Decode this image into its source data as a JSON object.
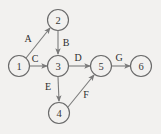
{
  "diagram": {
    "type": "directed-graph",
    "background_color": "#f2f1ef",
    "node_stroke_color": "#6a6a6a",
    "edge_stroke_color": "#7a7a7a",
    "text_color": "#2e2e2e",
    "nodes": [
      {
        "id": "1",
        "label": "1",
        "cx": 19,
        "cy": 66,
        "r": 10.5
      },
      {
        "id": "2",
        "label": "2",
        "cx": 58,
        "cy": 20,
        "r": 10.5
      },
      {
        "id": "3",
        "label": "3",
        "cx": 58,
        "cy": 66,
        "r": 10.5
      },
      {
        "id": "4",
        "label": "4",
        "cx": 59,
        "cy": 113,
        "r": 10.5
      },
      {
        "id": "5",
        "label": "5",
        "cx": 101,
        "cy": 66,
        "r": 10.5
      },
      {
        "id": "6",
        "label": "6",
        "cx": 141,
        "cy": 66,
        "r": 10.5
      }
    ],
    "edges": [
      {
        "id": "A",
        "label": "A",
        "from": "1",
        "to": "2",
        "x1": 26,
        "y1": 58,
        "x2": 50,
        "y2": 28,
        "lx": 28,
        "ly": 38
      },
      {
        "id": "B",
        "label": "B",
        "from": "2",
        "to": "3",
        "x1": 58,
        "y1": 31,
        "x2": 58,
        "y2": 54,
        "lx": 66,
        "ly": 42
      },
      {
        "id": "C",
        "label": "C",
        "from": "1",
        "to": "3",
        "x1": 30,
        "y1": 66,
        "x2": 47,
        "y2": 66,
        "lx": 35,
        "ly": 58
      },
      {
        "id": "D",
        "label": "D",
        "from": "3",
        "to": "5",
        "x1": 69,
        "y1": 66,
        "x2": 90,
        "y2": 66,
        "lx": 78,
        "ly": 57
      },
      {
        "id": "E",
        "label": "E",
        "from": "3",
        "to": "4",
        "x1": 58,
        "y1": 77,
        "x2": 59,
        "y2": 101,
        "lx": 48,
        "ly": 86
      },
      {
        "id": "F",
        "label": "F",
        "from": "4",
        "to": "5",
        "x1": 68,
        "y1": 107,
        "x2": 94,
        "y2": 75,
        "lx": 86,
        "ly": 94
      },
      {
        "id": "G",
        "label": "G",
        "from": "5",
        "to": "6",
        "x1": 112,
        "y1": 66,
        "x2": 130,
        "y2": 66,
        "lx": 119,
        "ly": 57
      }
    ]
  }
}
